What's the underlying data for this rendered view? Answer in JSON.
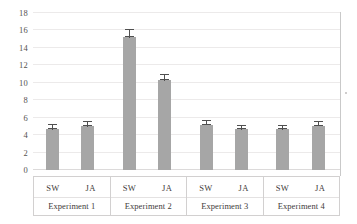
{
  "chart_data": {
    "type": "bar",
    "title": "",
    "subtitle": "",
    "xlabel": "",
    "ylabel": "",
    "ylim": [
      0,
      18
    ],
    "ytick_step": 2,
    "yticks": [
      18,
      16,
      14,
      12,
      10,
      8,
      6,
      4,
      2,
      0
    ],
    "grid": true,
    "legend": "none",
    "categories": [
      "Experiment 1",
      "Experiment 2",
      "Experiment 3",
      "Experiment 4"
    ],
    "conditions": [
      "SW",
      "JA"
    ],
    "series": [
      {
        "name": "SW",
        "values": [
          4.7,
          15.2,
          5.2,
          4.7
        ],
        "errors": [
          0.45,
          0.8,
          0.45,
          0.4
        ]
      },
      {
        "name": "JA",
        "values": [
          5.0,
          10.3,
          4.7,
          5.1
        ],
        "errors": [
          0.5,
          0.6,
          0.4,
          0.45
        ]
      }
    ],
    "bars": [
      {
        "group": "Experiment 1",
        "condition": "SW",
        "value": 4.7,
        "error": 0.45
      },
      {
        "group": "Experiment 1",
        "condition": "JA",
        "value": 5.0,
        "error": 0.5
      },
      {
        "group": "Experiment 2",
        "condition": "SW",
        "value": 15.2,
        "error": 0.8
      },
      {
        "group": "Experiment 2",
        "condition": "JA",
        "value": 10.3,
        "error": 0.6
      },
      {
        "group": "Experiment 3",
        "condition": "SW",
        "value": 5.2,
        "error": 0.45
      },
      {
        "group": "Experiment 3",
        "condition": "JA",
        "value": 4.7,
        "error": 0.4
      },
      {
        "group": "Experiment 4",
        "condition": "SW",
        "value": 4.7,
        "error": 0.4
      },
      {
        "group": "Experiment 4",
        "condition": "JA",
        "value": 5.1,
        "error": 0.45
      }
    ],
    "colors": {
      "bar_fill": "#a6a6a6",
      "error_bar": "#4f4f4f",
      "gridline": "#eceaea",
      "axis_line": "#dcdada",
      "text": "#3f3c3b",
      "background": "#ffffff"
    }
  }
}
